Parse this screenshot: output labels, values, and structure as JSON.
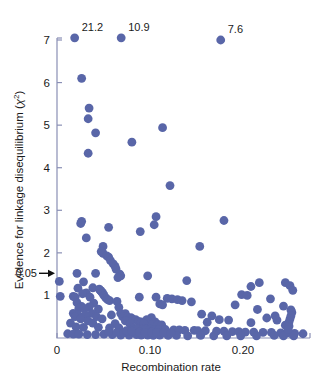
{
  "chart_data": {
    "type": "scatter",
    "title": "",
    "xlabel": "Recombination rate",
    "ylabel": "Evidence for linkage disequilibrium (χ²)",
    "ylabel_base": "Evidence for linkage disequilibrium (",
    "ylabel_symbol": "χ",
    "ylabel_exp": "2",
    "ylabel_close": ")",
    "xlim": [
      0,
      0.272
    ],
    "ylim": [
      0,
      7.15
    ],
    "grid": false,
    "legend": "none",
    "marker_color": "#5966a8",
    "marker_size": 4.4,
    "axis_color": "#8a8fb5",
    "xticks": [
      {
        "value": 0,
        "label": "0"
      },
      {
        "value": 0.1,
        "label": "0.10"
      },
      {
        "value": 0.2,
        "label": "0.20"
      }
    ],
    "xminor_ticks": [
      0.05,
      0.15,
      0.25
    ],
    "yticks": [
      {
        "value": 1,
        "label": "1"
      },
      {
        "value": 2,
        "label": "2"
      },
      {
        "value": 3,
        "label": "3"
      },
      {
        "value": 4,
        "label": "4"
      },
      {
        "value": 5,
        "label": "5"
      },
      {
        "value": 6,
        "label": "6"
      },
      {
        "value": 7,
        "label": "7"
      }
    ],
    "annotations": [
      {
        "name": "significance-threshold",
        "label": "0.05",
        "y": 1.52,
        "arrow": true
      },
      {
        "name": "outlier-label-1",
        "label": "21.2",
        "x": 0.019,
        "y": 7.05
      },
      {
        "name": "outlier-label-2",
        "label": "10.9",
        "x": 0.069,
        "y": 7.05
      },
      {
        "name": "outlier-label-3",
        "label": "7.6",
        "x": 0.176,
        "y": 7.0
      }
    ],
    "points": [
      [
        0.019,
        7.05
      ],
      [
        0.069,
        7.05
      ],
      [
        0.176,
        7.0
      ],
      [
        0.0265,
        6.1
      ],
      [
        0.0345,
        5.4
      ],
      [
        0.0335,
        5.15
      ],
      [
        0.1135,
        4.94
      ],
      [
        0.0415,
        4.82
      ],
      [
        0.0805,
        4.6
      ],
      [
        0.0335,
        4.34
      ],
      [
        0.1215,
        3.58
      ],
      [
        0.1065,
        2.85
      ],
      [
        0.1795,
        2.76
      ],
      [
        0.0265,
        2.74
      ],
      [
        0.0255,
        2.69
      ],
      [
        0.1045,
        2.66
      ],
      [
        0.0555,
        2.6
      ],
      [
        0.0895,
        2.5
      ],
      [
        0.0315,
        2.35
      ],
      [
        0.1535,
        2.15
      ],
      [
        0.0495,
        2.15
      ],
      [
        0.0475,
        2.03
      ],
      [
        0.0495,
        1.99
      ],
      [
        0.0535,
        1.93
      ],
      [
        0.0555,
        1.9
      ],
      [
        0.0575,
        1.82
      ],
      [
        0.0605,
        1.74
      ],
      [
        0.0625,
        1.68
      ],
      [
        0.0635,
        1.62
      ],
      [
        0.0215,
        1.52
      ],
      [
        0.0415,
        1.52
      ],
      [
        0.0675,
        1.5
      ],
      [
        0.0685,
        1.46
      ],
      [
        0.0975,
        1.46
      ],
      [
        0.0655,
        1.42
      ],
      [
        0.1395,
        1.35
      ],
      [
        0.0025,
        1.33
      ],
      [
        0.0285,
        1.32
      ],
      [
        0.2175,
        1.3
      ],
      [
        0.2455,
        1.3
      ],
      [
        0.2505,
        1.23
      ],
      [
        0.2085,
        1.21
      ],
      [
        0.0385,
        1.18
      ],
      [
        0.0225,
        1.17
      ],
      [
        0.0455,
        1.15
      ],
      [
        0.0465,
        1.12
      ],
      [
        0.2535,
        1.12
      ],
      [
        0.0475,
        1.1
      ],
      [
        0.0485,
        1.07
      ],
      [
        0.0315,
        1.06
      ],
      [
        0.0275,
        1.04
      ],
      [
        0.0495,
        1.04
      ],
      [
        0.1985,
        1.02
      ],
      [
        0.2045,
        1.0
      ],
      [
        0.0505,
        1.0
      ],
      [
        0.0035,
        0.98
      ],
      [
        0.0175,
        0.98
      ],
      [
        0.0195,
        0.96
      ],
      [
        0.0355,
        0.96
      ],
      [
        0.0885,
        0.96
      ],
      [
        0.1065,
        0.96
      ],
      [
        0.0525,
        0.94
      ],
      [
        0.1185,
        0.93
      ],
      [
        0.1235,
        0.92
      ],
      [
        0.2295,
        0.92
      ],
      [
        0.0545,
        0.9
      ],
      [
        0.0565,
        0.88
      ],
      [
        0.1295,
        0.9
      ],
      [
        0.1345,
        0.88
      ],
      [
        0.0645,
        0.86
      ],
      [
        0.1445,
        0.85
      ],
      [
        0.0215,
        0.83
      ],
      [
        0.0395,
        0.82
      ],
      [
        0.1105,
        0.8
      ],
      [
        0.1135,
        0.78
      ],
      [
        0.1915,
        0.78
      ],
      [
        0.2435,
        0.75
      ],
      [
        0.0265,
        0.74
      ],
      [
        0.0345,
        0.73
      ],
      [
        0.0665,
        0.72
      ],
      [
        0.0235,
        0.7
      ],
      [
        0.0295,
        0.69
      ],
      [
        0.0445,
        0.68
      ],
      [
        0.2155,
        0.67
      ],
      [
        0.2515,
        0.66
      ],
      [
        0.2525,
        0.6
      ],
      [
        0.0175,
        0.58
      ],
      [
        0.0375,
        0.58
      ],
      [
        0.0685,
        0.58
      ],
      [
        0.0735,
        0.57
      ],
      [
        0.1555,
        0.56
      ],
      [
        0.0225,
        0.55
      ],
      [
        0.0305,
        0.54
      ],
      [
        0.0585,
        0.54
      ],
      [
        0.1665,
        0.52
      ],
      [
        0.2345,
        0.52
      ],
      [
        0.0195,
        0.5
      ],
      [
        0.0425,
        0.5
      ],
      [
        0.0705,
        0.5
      ],
      [
        0.0755,
        0.49
      ],
      [
        0.0795,
        0.48
      ],
      [
        0.1015,
        0.48
      ],
      [
        0.2255,
        0.47
      ],
      [
        0.0255,
        0.45
      ],
      [
        0.0485,
        0.45
      ],
      [
        0.0815,
        0.44
      ],
      [
        0.0845,
        0.43
      ],
      [
        0.0965,
        0.43
      ],
      [
        0.1745,
        0.43
      ],
      [
        0.1845,
        0.42
      ],
      [
        0.2365,
        0.42
      ],
      [
        0.0335,
        0.4
      ],
      [
        0.0735,
        0.4
      ],
      [
        0.0875,
        0.39
      ],
      [
        0.0905,
        0.38
      ],
      [
        0.0985,
        0.38
      ],
      [
        0.1055,
        0.38
      ],
      [
        0.1615,
        0.37
      ],
      [
        0.2085,
        0.36
      ],
      [
        0.0145,
        0.35
      ],
      [
        0.0385,
        0.35
      ],
      [
        0.0625,
        0.34
      ],
      [
        0.0785,
        0.33
      ],
      [
        0.0935,
        0.33
      ],
      [
        0.1025,
        0.32
      ],
      [
        0.1085,
        0.32
      ],
      [
        0.1125,
        0.31
      ],
      [
        0.2455,
        0.3
      ],
      [
        0.2495,
        0.28
      ],
      [
        0.0205,
        0.26
      ],
      [
        0.0285,
        0.25
      ],
      [
        0.0445,
        0.25
      ],
      [
        0.0565,
        0.24
      ],
      [
        0.0665,
        0.24
      ],
      [
        0.0825,
        0.23
      ],
      [
        0.0865,
        0.22
      ],
      [
        0.0925,
        0.22
      ],
      [
        0.0955,
        0.21
      ],
      [
        0.1005,
        0.21
      ],
      [
        0.1045,
        0.2
      ],
      [
        0.1095,
        0.2
      ],
      [
        0.1165,
        0.2
      ],
      [
        0.1255,
        0.19
      ],
      [
        0.1315,
        0.19
      ],
      [
        0.1375,
        0.18
      ],
      [
        0.1475,
        0.18
      ],
      [
        0.1515,
        0.17
      ],
      [
        0.1595,
        0.17
      ],
      [
        0.1715,
        0.16
      ],
      [
        0.1795,
        0.16
      ],
      [
        0.1885,
        0.15
      ],
      [
        0.1955,
        0.15
      ],
      [
        0.2025,
        0.14
      ],
      [
        0.2115,
        0.14
      ],
      [
        0.2215,
        0.13
      ],
      [
        0.2305,
        0.13
      ],
      [
        0.2405,
        0.12
      ],
      [
        0.2475,
        0.12
      ],
      [
        0.2555,
        0.11
      ],
      [
        0.2645,
        0.1
      ],
      [
        0.0115,
        0.1
      ],
      [
        0.0175,
        0.09
      ],
      [
        0.0235,
        0.09
      ],
      [
        0.0325,
        0.08
      ],
      [
        0.0415,
        0.08
      ],
      [
        0.0505,
        0.09
      ],
      [
        0.0595,
        0.08
      ],
      [
        0.0685,
        0.07
      ],
      [
        0.0775,
        0.07
      ],
      [
        0.0855,
        0.08
      ],
      [
        0.0905,
        0.07
      ],
      [
        0.0975,
        0.07
      ],
      [
        0.1035,
        0.06
      ],
      [
        0.1105,
        0.07
      ],
      [
        0.1195,
        0.06
      ],
      [
        0.1285,
        0.06
      ],
      [
        0.1405,
        0.05
      ],
      [
        0.1545,
        0.06
      ],
      [
        0.1685,
        0.05
      ],
      [
        0.1825,
        0.05
      ],
      [
        0.1975,
        0.05
      ],
      [
        0.2145,
        0.05
      ],
      [
        0.2335,
        0.06
      ],
      [
        0.2435,
        0.05
      ],
      [
        0.2545,
        0.05
      ],
      [
        0.0555,
        0.14
      ],
      [
        0.0645,
        0.13
      ],
      [
        0.0715,
        0.12
      ],
      [
        0.0745,
        0.17
      ],
      [
        0.0805,
        0.16
      ],
      [
        0.0885,
        0.14
      ],
      [
        0.0945,
        0.13
      ],
      [
        0.1015,
        0.14
      ],
      [
        0.1075,
        0.13
      ],
      [
        0.1145,
        0.12
      ],
      [
        0.1225,
        0.12
      ],
      [
        0.2495,
        0.38
      ],
      [
        0.2505,
        0.45
      ],
      [
        0.2515,
        0.52
      ],
      [
        0.2485,
        0.2
      ]
    ]
  }
}
